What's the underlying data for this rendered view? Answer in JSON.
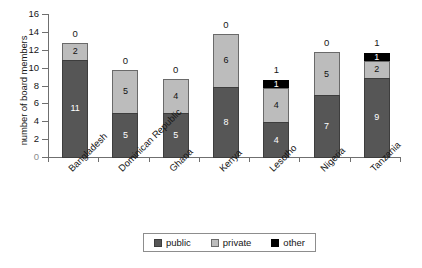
{
  "chart_data": {
    "type": "bar",
    "subtype": "stacked",
    "title": "",
    "subtitle": "",
    "xlabel": "",
    "ylabel": "number of board members",
    "ylim": [
      0,
      16
    ],
    "ytick_step": 2,
    "yticks": [
      0,
      2,
      4,
      6,
      8,
      10,
      12,
      14,
      16
    ],
    "ytick_labels": [
      "0",
      "2",
      "4",
      "6",
      "8",
      "10",
      "12",
      "14",
      "16"
    ],
    "grid": false,
    "legend_position": "bottom-center",
    "categories": [
      "Bangladesh",
      "Dominican Republic",
      "Ghana",
      "Kenya",
      "Lesotho",
      "Nigeria",
      "Tanzania"
    ],
    "series": [
      {
        "name": "public",
        "color": "#565656",
        "values": [
          11,
          5,
          5,
          8,
          4,
          7,
          9
        ]
      },
      {
        "name": "private",
        "color": "#bcbcbc",
        "values": [
          2,
          5,
          4,
          6,
          4,
          5,
          2
        ]
      },
      {
        "name": "other",
        "color": "#000000",
        "values": [
          0,
          0,
          0,
          0,
          1,
          0,
          1
        ]
      }
    ],
    "totals": [
      13,
      10,
      9,
      14,
      9,
      12,
      12
    ],
    "top_labels": [
      "0",
      "0",
      "0",
      "0",
      "1",
      "0",
      "1"
    ],
    "segment_labels": {
      "public": [
        "11",
        "5",
        "5",
        "8",
        "4",
        "7",
        "9"
      ],
      "private": [
        "2",
        "5",
        "4",
        "6",
        "4",
        "5",
        "2"
      ],
      "other": [
        "",
        "",
        "",
        "",
        "1",
        "",
        "1"
      ]
    }
  },
  "legend": {
    "items": [
      {
        "label": "public",
        "color": "#565656"
      },
      {
        "label": "private",
        "color": "#bcbcbc"
      },
      {
        "label": "other",
        "color": "#000000"
      }
    ]
  },
  "colors": {
    "public": "#565656",
    "private": "#bcbcbc",
    "other": "#000000",
    "axis": "#6f6f6f",
    "text": "#161616",
    "background": "#ffffff"
  }
}
